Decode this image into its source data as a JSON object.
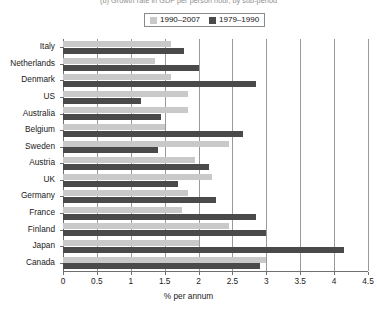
{
  "chart_data": {
    "type": "bar",
    "orientation": "horizontal",
    "title": "(b) Growth rate in GDP per person hour, by sub-period",
    "xlabel": "% per annum",
    "ylabel": "",
    "xlim": [
      0,
      4.5
    ],
    "xticks": [
      "0",
      "0.5",
      "1",
      "1.5",
      "2",
      "2.5",
      "3",
      "3.5",
      "4",
      "4.5"
    ],
    "xtick_values": [
      0,
      0.5,
      1,
      1.5,
      2,
      2.5,
      3,
      3.5,
      4,
      4.5
    ],
    "grid": "vertical",
    "legend_position": "top-center",
    "categories": [
      "Italy",
      "Netherlands",
      "Denmark",
      "US",
      "Australia",
      "Belgium",
      "Sweden",
      "Austria",
      "UK",
      "Germany",
      "France",
      "Finland",
      "Japan",
      "Canada"
    ],
    "series": [
      {
        "name": "1990–2007",
        "color": "#c9c9c9",
        "values": [
          1.6,
          1.35,
          1.6,
          1.85,
          1.85,
          1.5,
          2.45,
          1.95,
          2.2,
          1.85,
          1.75,
          2.45,
          2.0,
          3.0
        ]
      },
      {
        "name": "1979–1990",
        "color": "#4a4a4a",
        "values": [
          1.78,
          2.0,
          2.85,
          1.15,
          1.45,
          2.65,
          1.4,
          2.15,
          1.7,
          2.25,
          2.85,
          3.0,
          4.15,
          2.9
        ]
      }
    ]
  },
  "colors": {
    "series_light": "#c9c9c9",
    "series_dark": "#4a4a4a",
    "axis": "#6f6f6f",
    "grid": "#9a9a9a",
    "text": "#1a1a1a",
    "title": "#8c8c8c",
    "background": "#ffffff"
  }
}
